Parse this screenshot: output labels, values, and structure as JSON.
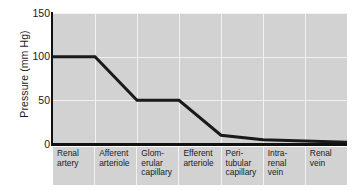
{
  "chart_data": {
    "type": "line",
    "title": "",
    "xlabel": "",
    "ylabel": "Pressure (mm Hg)",
    "ylim": [
      0,
      150
    ],
    "yticks": [
      150,
      100,
      50,
      0
    ],
    "grid": true,
    "legend": "none",
    "categories": [
      "Renal artery",
      "Afferent arteriole",
      "Glomerular capillary",
      "Efferent arteriole",
      "Peritubular capillary",
      "Intrarenal vein",
      "Renal vein"
    ],
    "category_lines": [
      [
        "Renal",
        "artery"
      ],
      [
        "Afferent",
        "arteriole"
      ],
      [
        "Glom-",
        "erular",
        "capillary"
      ],
      [
        "Efferent",
        "arteriole"
      ],
      [
        "Peri-",
        "tubular",
        "capillary"
      ],
      [
        "Intra-",
        "renal",
        "vein"
      ],
      [
        "Renal",
        "vein"
      ]
    ],
    "series": [
      {
        "name": "Pressure",
        "color": "#1a1a1a",
        "points": [
          {
            "x": 0.0,
            "y": 100
          },
          {
            "x": 1.0,
            "y": 100
          },
          {
            "x": 2.0,
            "y": 50
          },
          {
            "x": 3.0,
            "y": 50
          },
          {
            "x": 4.0,
            "y": 10
          },
          {
            "x": 5.0,
            "y": 5
          },
          {
            "x": 7.0,
            "y": 2
          }
        ]
      }
    ],
    "colors": {
      "plot_background": "#d2d2d2",
      "gridline": "#f2f2f2",
      "axis": "#111111",
      "line": "#1a1a1a",
      "page_background": "#ffffff"
    }
  }
}
